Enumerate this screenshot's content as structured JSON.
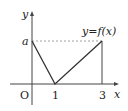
{
  "diagram": {
    "type": "function-graph",
    "curve_label": "y=f(x)",
    "axes": {
      "x_label": "x",
      "y_label": "y",
      "origin_label": "O"
    },
    "x_ticks": [
      "1",
      "3"
    ],
    "y_ticks": [
      "a"
    ],
    "points": [
      {
        "x": "0",
        "y": "a"
      },
      {
        "x": "1",
        "y": "0"
      },
      {
        "x": "3",
        "y": "a"
      }
    ],
    "guide_lines": [
      {
        "type": "dashed",
        "from": "(0,a)",
        "to": "(3,a)"
      },
      {
        "type": "solid",
        "from": "(3,a)",
        "to": "(3,0)"
      }
    ],
    "colors": {
      "line": "#333333",
      "dashed": "#888888",
      "text": "#222222"
    }
  }
}
